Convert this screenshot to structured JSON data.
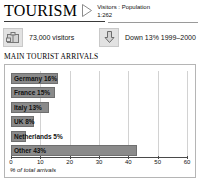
{
  "header": {
    "title": "TOURISM",
    "ratio_label": "Visitors : Population",
    "ratio_value": "1:262",
    "triangle_icon": "triangle-right-icon"
  },
  "stats": [
    {
      "icon": "suitcase-icon",
      "label": "73,000 visitors"
    },
    {
      "icon": "down-arrow-icon",
      "label": "Down 13% 1999–2000"
    }
  ],
  "section": {
    "title": "MAIN TOURIST ARRIVALS"
  },
  "chart_data": {
    "type": "bar",
    "orientation": "horizontal",
    "title": "MAIN TOURIST ARRIVALS",
    "xlabel": "% of total arrivals",
    "ylabel": "",
    "xlim": [
      0,
      60
    ],
    "ticks": [
      0,
      10,
      20,
      30,
      40,
      50,
      60
    ],
    "grid": true,
    "legend": "none",
    "bar_color": "#8a8a8a",
    "categories": [
      "Germany",
      "France",
      "Italy",
      "UK",
      "Netherlands",
      "Other"
    ],
    "values": [
      16,
      15,
      13,
      8,
      5,
      43
    ],
    "labels": [
      "Germany 16%",
      "France 15%",
      "Italy 13%",
      "UK 8%",
      "Netherlands 5%",
      "Other 43%"
    ]
  }
}
